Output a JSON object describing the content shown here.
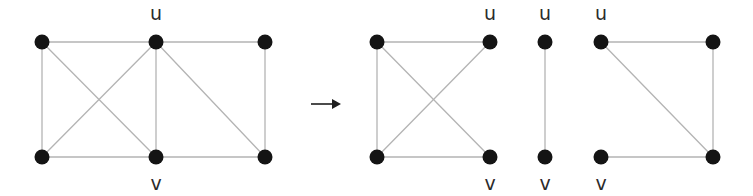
{
  "figure": {
    "width": 753,
    "height": 196,
    "background_color": "#ffffff",
    "node_color": "#141414",
    "edge_color": "#b4b4b4",
    "label_color": "#2b2b2b",
    "arrow_color": "#1f1f1f",
    "node_radius": 7.5,
    "labels": {
      "u": "u",
      "v": "v"
    },
    "arrow": {
      "name": "implies-arrow",
      "x1": 311,
      "y1": 104,
      "x2": 341,
      "y2": 104,
      "head_size": 7
    },
    "graphs": [
      {
        "name": "source-graph",
        "nodes": [
          {
            "id": "a",
            "x": 42,
            "y": 42,
            "label": ""
          },
          {
            "id": "u",
            "x": 156,
            "y": 42,
            "label": "u",
            "label_x": 156,
            "label_y": 14
          },
          {
            "id": "c",
            "x": 265,
            "y": 42,
            "label": ""
          },
          {
            "id": "d",
            "x": 42,
            "y": 157,
            "label": ""
          },
          {
            "id": "v",
            "x": 156,
            "y": 157,
            "label": "v",
            "label_x": 156,
            "label_y": 184
          },
          {
            "id": "f",
            "x": 265,
            "y": 157,
            "label": ""
          }
        ],
        "edges": [
          {
            "from": "a",
            "to": "u"
          },
          {
            "from": "u",
            "to": "c"
          },
          {
            "from": "a",
            "to": "d"
          },
          {
            "from": "d",
            "to": "v"
          },
          {
            "from": "v",
            "to": "f"
          },
          {
            "from": "c",
            "to": "f"
          },
          {
            "from": "u",
            "to": "v"
          },
          {
            "from": "a",
            "to": "v"
          },
          {
            "from": "u",
            "to": "d"
          },
          {
            "from": "u",
            "to": "f"
          }
        ]
      },
      {
        "name": "result-graph-1",
        "nodes": [
          {
            "id": "a",
            "x": 377,
            "y": 42,
            "label": ""
          },
          {
            "id": "u",
            "x": 490,
            "y": 42,
            "label": "u",
            "label_x": 490,
            "label_y": 14
          },
          {
            "id": "d",
            "x": 377,
            "y": 157,
            "label": ""
          },
          {
            "id": "v",
            "x": 490,
            "y": 157,
            "label": "v",
            "label_x": 490,
            "label_y": 184
          }
        ],
        "edges": [
          {
            "from": "a",
            "to": "u"
          },
          {
            "from": "a",
            "to": "d"
          },
          {
            "from": "d",
            "to": "v"
          },
          {
            "from": "a",
            "to": "v"
          },
          {
            "from": "u",
            "to": "d"
          }
        ]
      },
      {
        "name": "result-graph-2",
        "nodes": [
          {
            "id": "u",
            "x": 545,
            "y": 42,
            "label": "u",
            "label_x": 545,
            "label_y": 14
          },
          {
            "id": "v",
            "x": 545,
            "y": 157,
            "label": "v",
            "label_x": 545,
            "label_y": 184
          }
        ],
        "edges": [
          {
            "from": "u",
            "to": "v"
          }
        ]
      },
      {
        "name": "result-graph-3",
        "nodes": [
          {
            "id": "u",
            "x": 601,
            "y": 42,
            "label": "u",
            "label_x": 601,
            "label_y": 14
          },
          {
            "id": "c",
            "x": 713,
            "y": 42,
            "label": ""
          },
          {
            "id": "v",
            "x": 601,
            "y": 157,
            "label": "v",
            "label_x": 601,
            "label_y": 184
          },
          {
            "id": "f",
            "x": 713,
            "y": 157,
            "label": ""
          }
        ],
        "edges": [
          {
            "from": "u",
            "to": "c"
          },
          {
            "from": "c",
            "to": "f"
          },
          {
            "from": "v",
            "to": "f"
          },
          {
            "from": "u",
            "to": "f"
          }
        ]
      }
    ]
  }
}
